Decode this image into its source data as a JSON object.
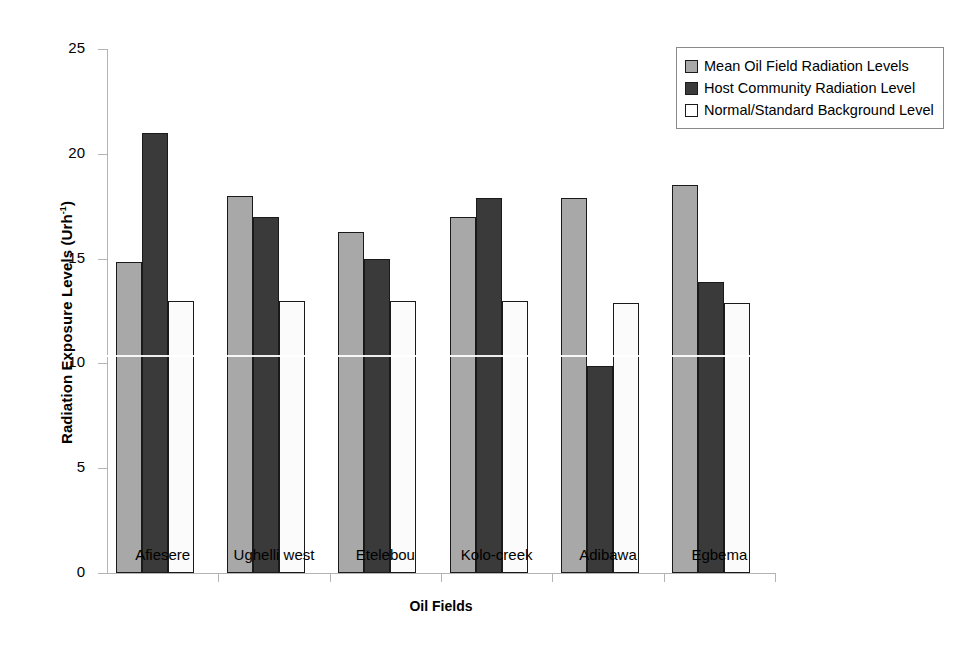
{
  "chart_data": {
    "type": "bar",
    "title": "",
    "xlabel": "Oil Fields",
    "ylabel": "Radiation Exposure Levels (Urh-1)",
    "ylabel_base": "Radiation Exposure Levels (Urh",
    "ylabel_sup": "-1",
    "ylabel_tail": ")",
    "categories": [
      "Afiesere",
      "Ughelli west",
      "Etelebou",
      "Kolo-creek",
      "Adibawa",
      "Egbema"
    ],
    "series": [
      {
        "name": "Mean Oil Field Radiation Levels",
        "color": "#a8a8a8",
        "values": [
          14.85,
          18.0,
          16.25,
          17.0,
          17.9,
          18.5
        ]
      },
      {
        "name": "Host Community Radiation Level",
        "color": "#3a3a3a",
        "values": [
          21.0,
          17.0,
          15.0,
          17.9,
          9.9,
          13.9
        ]
      },
      {
        "name": "Normal/Standard Background Level",
        "color": "#ffffff",
        "values": [
          13.0,
          13.0,
          13.0,
          13.0,
          12.9,
          12.9
        ]
      }
    ],
    "ylim": [
      0,
      25
    ],
    "yticks": [
      0,
      5,
      10,
      15,
      20,
      25
    ],
    "ytick_labels": [
      "0",
      "5",
      "10",
      "15",
      "20",
      "25"
    ],
    "grid": false,
    "legend_position": "top-right"
  },
  "legend": {
    "entries": [
      "Mean Oil Field Radiation Levels",
      "Host Community Radiation Level",
      "Normal/Standard Background Level"
    ]
  }
}
